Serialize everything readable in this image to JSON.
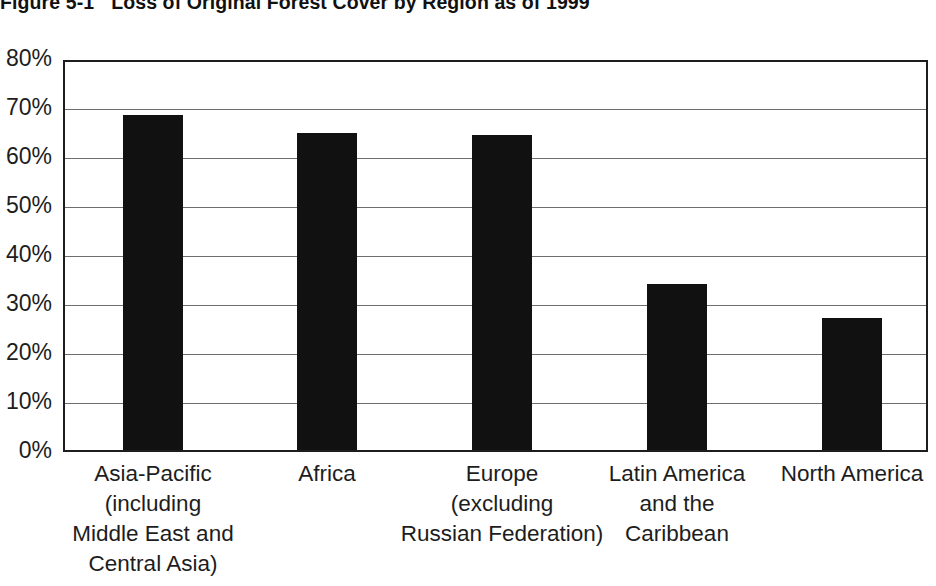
{
  "figure": {
    "number": "Figure 5-1",
    "title": "Loss of Original Forest Cover by Region as of 1999"
  },
  "chart_data": {
    "type": "bar",
    "title": "Loss of Original Forest Cover by Region as of 1999",
    "xlabel": "",
    "ylabel": "",
    "ylim": [
      0,
      80
    ],
    "grid": true,
    "legend": "none",
    "yticks": [
      "0%",
      "10%",
      "20%",
      "30%",
      "40%",
      "50%",
      "60%",
      "70%",
      "80%"
    ],
    "ytick_values": [
      0,
      10,
      20,
      30,
      40,
      50,
      60,
      70,
      80
    ],
    "categories": [
      "Asia-Pacific (including Middle East and Central Asia)",
      "Africa",
      "Europe (excluding Russian Federation)",
      "Latin America and the Caribbean",
      "North America"
    ],
    "category_lines": [
      [
        "Asia-Pacific",
        "(including",
        "Middle East and",
        "Central Asia)"
      ],
      [
        "Africa"
      ],
      [
        "Europe",
        "(excluding",
        "Russian Federation)"
      ],
      [
        "Latin America",
        "and the",
        "Caribbean"
      ],
      [
        "North America"
      ]
    ],
    "values": [
      68.4,
      64.7,
      64.2,
      33.8,
      27.0
    ],
    "bar_color": "#111111"
  }
}
